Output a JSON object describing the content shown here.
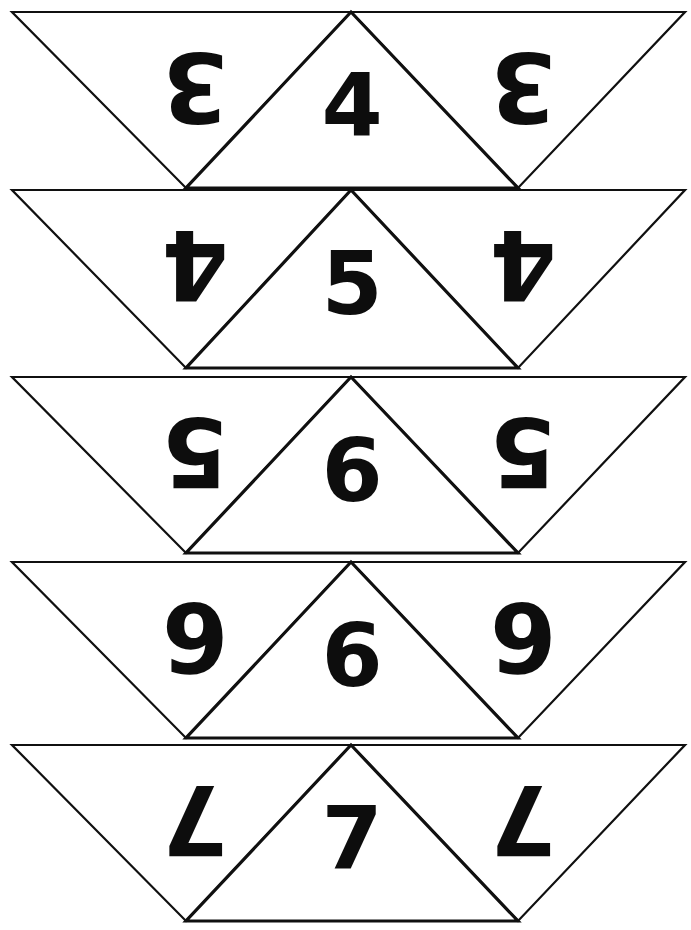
{
  "page": {
    "background_color": "#ffffff",
    "ink_color": "#0d0d0d",
    "width": 691,
    "height": 930
  },
  "sheet": {
    "row_count": 5,
    "columns_per_row": 3,
    "left": 12,
    "right": 685,
    "row_top_positions": [
      12,
      190,
      377,
      562,
      745
    ],
    "row_height": 176,
    "apex_left_x": 186,
    "apex_right_x": 518,
    "center_apex_x": 351
  },
  "rows": [
    {
      "index": 1,
      "top": 12,
      "bottom": 188,
      "left_triangle": {
        "shape": "down-triangle",
        "digit": "3",
        "rotated": true
      },
      "center_triangle": {
        "shape": "up-triangle",
        "digit": "4",
        "rotated": false
      },
      "right_triangle": {
        "shape": "down-triangle",
        "digit": "3",
        "rotated": true
      }
    },
    {
      "index": 2,
      "top": 190,
      "bottom": 368,
      "left_triangle": {
        "shape": "down-triangle",
        "digit": "4",
        "rotated": true
      },
      "center_triangle": {
        "shape": "up-triangle",
        "digit": "5",
        "rotated": false
      },
      "right_triangle": {
        "shape": "down-triangle",
        "digit": "4",
        "rotated": true
      }
    },
    {
      "index": 3,
      "top": 377,
      "bottom": 553,
      "left_triangle": {
        "shape": "down-triangle",
        "digit": "5",
        "rotated": true
      },
      "center_triangle": {
        "shape": "up-triangle",
        "digit": "6",
        "rotated": false
      },
      "right_triangle": {
        "shape": "down-triangle",
        "digit": "5",
        "rotated": true
      }
    },
    {
      "index": 4,
      "top": 562,
      "bottom": 738,
      "left_triangle": {
        "shape": "down-triangle",
        "digit": "6",
        "rotated": true
      },
      "center_triangle": {
        "shape": "up-triangle",
        "digit": "6",
        "rotated": false
      },
      "right_triangle": {
        "shape": "down-triangle",
        "digit": "6",
        "rotated": true
      }
    },
    {
      "index": 5,
      "top": 745,
      "bottom": 921,
      "left_triangle": {
        "shape": "down-triangle",
        "digit": "7",
        "rotated": true
      },
      "center_triangle": {
        "shape": "up-triangle",
        "digit": "7",
        "rotated": false
      },
      "right_triangle": {
        "shape": "down-triangle",
        "digit": "7",
        "rotated": true
      }
    }
  ]
}
